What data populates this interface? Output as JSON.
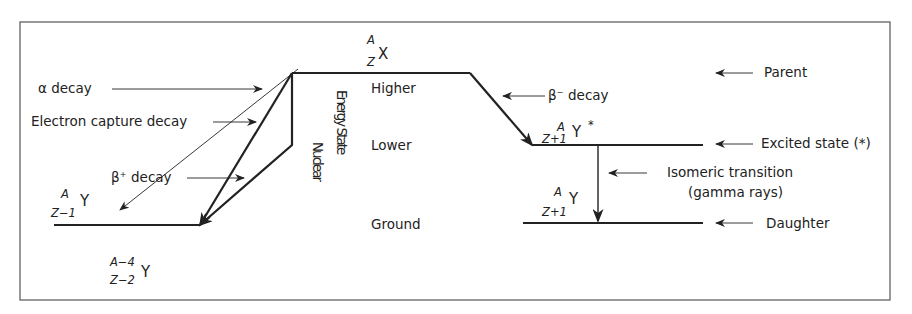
{
  "diagram": {
    "parent_nuclide": {
      "A": "A",
      "Z": "Z",
      "symbol": "X"
    },
    "beta_minus_product": {
      "A": "A",
      "Z": "Z+1",
      "symbol": "Y",
      "mark": "*"
    },
    "daughter_ground": {
      "A": "A",
      "Z": "Z+1",
      "symbol": "Y"
    },
    "ec_beta_plus_product": {
      "A": "A",
      "Z": "Z−1",
      "symbol": "Y"
    },
    "alpha_product": {
      "A": "A−4",
      "Z": "Z−2",
      "symbol": "Y"
    },
    "left_labels": {
      "alpha": "α decay",
      "electron_capture": "Electron capture decay",
      "beta_plus": "β⁺ decay"
    },
    "vertical_axis": {
      "nuclear": "Nuclear",
      "energy_state": "Energy State"
    },
    "levels": {
      "higher": "Higher",
      "lower": "Lower",
      "ground": "Ground"
    },
    "right_labels": {
      "beta_minus": "β⁻ decay",
      "parent": "Parent",
      "excited": "Excited state (*)",
      "isomeric_line1": "Isomeric transition",
      "isomeric_line2": "(gamma rays)",
      "daughter": "Daughter"
    },
    "colors": {
      "line": "#222222",
      "frame": "#555555",
      "background": "#ffffff"
    }
  }
}
